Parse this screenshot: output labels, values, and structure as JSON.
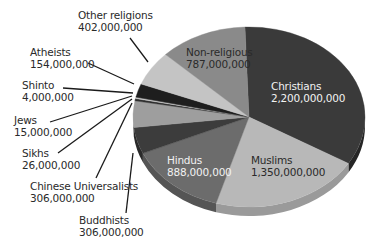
{
  "chart_data": {
    "type": "pie",
    "title": "",
    "style": "3d-tilted-grayscale",
    "unit": "people",
    "start_angle_deg": -92,
    "direction": "clockwise",
    "slices": [
      {
        "label": "Christians",
        "value": 2200000000,
        "value_label": "2,200,000,000",
        "color": "#3a3a3a",
        "side": "#262626",
        "label_inside": true,
        "label_inverted": true
      },
      {
        "label": "Muslims",
        "value": 1350000000,
        "value_label": "1,350,000,000",
        "color": "#b8b8b8",
        "side": "#9a9a9a",
        "label_inside": true,
        "label_inverted": false
      },
      {
        "label": "Hindus",
        "value": 888000000,
        "value_label": "888,000,000",
        "color": "#6c6c6c",
        "side": "#555555",
        "label_inside": true,
        "label_inverted": true
      },
      {
        "label": "Buddhists",
        "value": 306000000,
        "value_label": "306,000,000",
        "color": "#3c3c3c",
        "side": "#2a2a2a",
        "label_inside": false
      },
      {
        "label": "Chinese Universalists",
        "value": 306000000,
        "value_label": "306,000,000",
        "color": "#9e9e9e",
        "side": "#808080",
        "label_inside": false
      },
      {
        "label": "Sikhs",
        "value": 26000000,
        "value_label": "26,000,000",
        "color": "#2e2e2e",
        "side": "#222222",
        "label_inside": false
      },
      {
        "label": "Jews",
        "value": 15000000,
        "value_label": "15,000,000",
        "color": "#c8c8c8",
        "side": "#aaaaaa",
        "label_inside": false
      },
      {
        "label": "Shinto",
        "value": 4000000,
        "value_label": "4,000,000",
        "color": "#7a7a7a",
        "side": "#666666",
        "label_inside": false
      },
      {
        "label": "Atheists",
        "value": 154000000,
        "value_label": "154,000,000",
        "color": "#1e1e1e",
        "side": "#141414",
        "label_inside": false
      },
      {
        "label": "Other religions",
        "value": 402000000,
        "value_label": "402,000,000",
        "color": "#c4c4c4",
        "side": "#a8a8a8",
        "label_inside": false
      },
      {
        "label": "Non-religious",
        "value": 787000000,
        "value_label": "787,000,000",
        "color": "#8a8a8a",
        "side": "#707070",
        "label_inside": true,
        "label_inverted": false
      }
    ],
    "legend": "none (callout labels)"
  },
  "labels": {
    "christians": {
      "name": "Christians",
      "value": "2,200,000,000"
    },
    "muslims": {
      "name": "Muslims",
      "value": "1,350,000,000"
    },
    "hindus": {
      "name": "Hindus",
      "value": "888,000,000"
    },
    "non_religious": {
      "name": "Non-religious",
      "value": "787,000,000"
    },
    "other_religions": {
      "name": "Other religions",
      "value": "402,000,000"
    },
    "atheists": {
      "name": "Atheists",
      "value": "154,000,000"
    },
    "shinto": {
      "name": "Shinto",
      "value": "4,000,000"
    },
    "jews": {
      "name": "Jews",
      "value": "15,000,000"
    },
    "sikhs": {
      "name": "Sikhs",
      "value": "26,000,000"
    },
    "chinese_universalists": {
      "name": "Chinese Universalists",
      "value": "306,000,000"
    },
    "buddhists": {
      "name": "Buddhists",
      "value": "306,000,000"
    }
  }
}
